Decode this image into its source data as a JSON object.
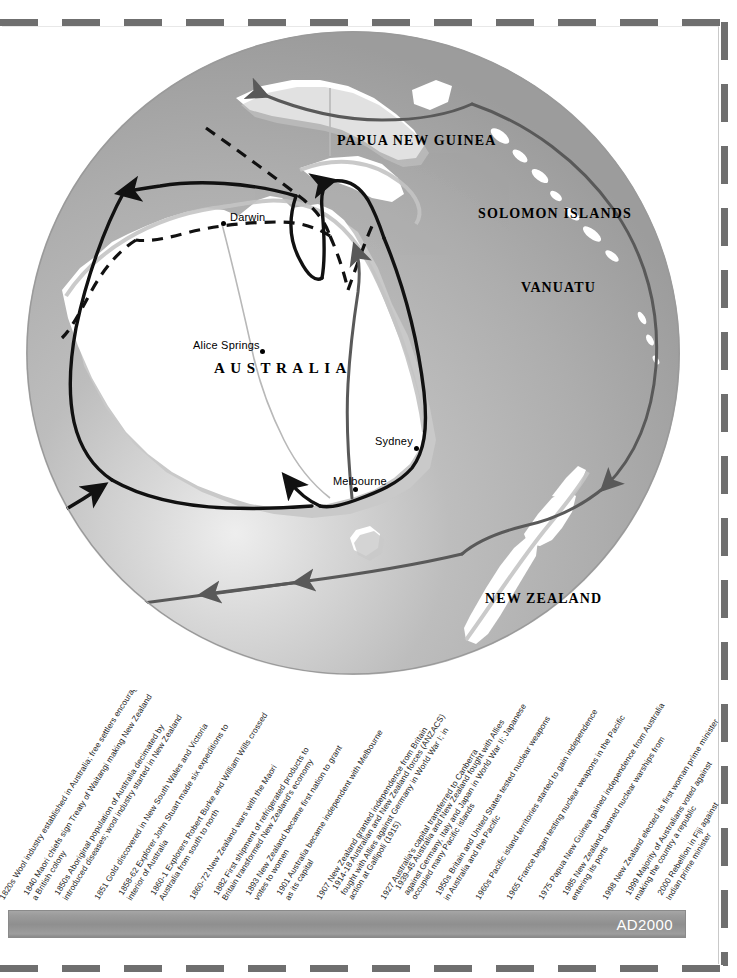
{
  "map": {
    "regions": [
      {
        "name": "papua-new-guinea",
        "label": "PAPUA NEW\nGUINEA",
        "line1": "PAPUA NEW",
        "line2": "GUINEA",
        "x": 337,
        "y": 112
      },
      {
        "name": "solomon-islands",
        "label": "SOLOMON\nISLANDS",
        "line1": "SOLOMON",
        "line2": "ISLANDS",
        "x": 478,
        "y": 185
      },
      {
        "name": "vanuatu",
        "label": "VANUATU",
        "line1": "VANUATU",
        "line2": "",
        "x": 521,
        "y": 259
      },
      {
        "name": "new-zealand",
        "label": "NEW ZEALAND",
        "line1": "NEW ZEALAND",
        "line2": "",
        "x": 485,
        "y": 570
      }
    ],
    "country": {
      "label": "AUSTRALIA",
      "x": 214,
      "y": 342
    },
    "cities": [
      {
        "name": "darwin",
        "label": "Darwin",
        "label_x": 230,
        "label_y": 190,
        "dot_x": 221,
        "dot_y": 196
      },
      {
        "name": "alice-springs",
        "label": "Alice Springs",
        "label_x": 193,
        "label_y": 318,
        "dot_x": 260,
        "dot_y": 324
      },
      {
        "name": "sydney",
        "label": "Sydney",
        "label_x": 375,
        "label_y": 414,
        "dot_x": 414,
        "dot_y": 421
      },
      {
        "name": "melbourne",
        "label": "Melbourne",
        "label_x": 333,
        "label_y": 454,
        "dot_x": 353,
        "dot_y": 462
      }
    ],
    "colors": {
      "ocean": "#b0b0b0",
      "land": "#ffffff",
      "coast_shadow": "#c9c9c9",
      "route_solid": "#111111",
      "route_grey": "#595959",
      "page": "#ffffff"
    }
  },
  "timeline": {
    "end_label": "AD2000",
    "entries": [
      {
        "year": "1820s",
        "lines": [
          "1820s Wool industry established in Australia; free settlers encouraged"
        ]
      },
      {
        "year": "1840",
        "lines": [
          "1840 Maori chiefs sign Treaty of Waitangi making New Zealand",
          "a British colony"
        ]
      },
      {
        "year": "1850s",
        "lines": [
          "1850s Aboriginal population of Australia decimated by",
          "introduced diseases; wool industry started in New Zealand"
        ]
      },
      {
        "year": "1851",
        "lines": [
          "1851 Gold discovered in New South Wales and Victoria"
        ]
      },
      {
        "year": "1858-62",
        "lines": [
          "1858-62 Explorer John Stuart made six expeditions to",
          "interior of Australia"
        ]
      },
      {
        "year": "1860-1",
        "lines": [
          "1860-1 Explorers Robert Burke and William Wills crossed",
          "Australia from south to north"
        ]
      },
      {
        "year": "1860-72",
        "lines": [
          "1860-72 New Zealand wars with the Maori"
        ]
      },
      {
        "year": "1882",
        "lines": [
          "1882 First shipment of refrigerated products to",
          "Britain transformed New Zealand's economy"
        ]
      },
      {
        "year": "1893",
        "lines": [
          "1893 New Zealand became first nation to grant",
          "votes to women"
        ]
      },
      {
        "year": "1901",
        "lines": [
          "1901 Australia became independent with Melbourne",
          "as its capital"
        ]
      },
      {
        "year": "1907",
        "lines": [
          "1907 New Zealand granted independence from Britain"
        ]
      },
      {
        "year": "1914-18",
        "lines": [
          "1914-18 Australian and New Zealand forces (ANZACS)",
          "fought with Allies against Germany in World War I; in",
          "action at Gallipoli (1915)"
        ]
      },
      {
        "year": "1927",
        "lines": [
          "1927 Australia's capital transferred to Canberra"
        ]
      },
      {
        "year": "1939-45",
        "lines": [
          "1939-45 Australia and New Zealand fought with Allies",
          "against Germany, Italy and Japan in World War II; Japanese",
          "occupied many Pacific islands"
        ]
      },
      {
        "year": "1950s",
        "lines": [
          "1950s Britain and United States tested nuclear weapons",
          "in Australia and the Pacific"
        ]
      },
      {
        "year": "1960s",
        "lines": [
          "1960s Pacific island territories started to gain independence"
        ]
      },
      {
        "year": "1965",
        "lines": [
          "1965 France began testing nuclear weapons in the Pacific"
        ]
      },
      {
        "year": "1975",
        "lines": [
          "1975 Papua New Guinea gained independence from Australia"
        ]
      },
      {
        "year": "1985",
        "lines": [
          "1985 New Zealand banned nuclear warships from",
          "entering its ports"
        ]
      },
      {
        "year": "1998",
        "lines": [
          "1998 New Zealand elected its first woman prime minister"
        ]
      },
      {
        "year": "1999",
        "lines": [
          "1999 Majority of Australians voted against",
          "making the country a republic"
        ]
      },
      {
        "year": "2000",
        "lines": [
          "2000 Rebellion in Fiji against",
          "Indian prime minister"
        ]
      }
    ]
  }
}
